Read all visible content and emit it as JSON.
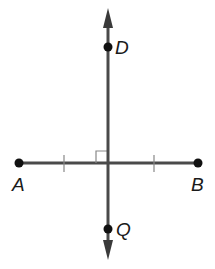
{
  "diagram": {
    "type": "geometry",
    "colors": {
      "line": "#3a3a3a",
      "point": "#111111",
      "tick": "#777777",
      "label": "#1a1a1a"
    },
    "points": [
      {
        "id": "A",
        "label": "A",
        "x": 19,
        "y": 163
      },
      {
        "id": "B",
        "label": "B",
        "x": 198,
        "y": 163
      },
      {
        "id": "D",
        "label": "D",
        "x": 108,
        "y": 47
      },
      {
        "id": "Q",
        "label": "Q",
        "x": 108,
        "y": 229
      }
    ],
    "segment_AB": {
      "from": "A",
      "to": "B",
      "congruence_ticks": 2
    },
    "line_DQ": {
      "direction": "vertical",
      "arrows": "both",
      "perpendicular_to": "AB"
    },
    "right_angle_marker": true
  }
}
